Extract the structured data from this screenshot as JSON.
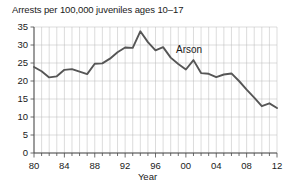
{
  "chart_data": {
    "type": "line",
    "title": "Arrests per 100,000 juveniles ages 10–17",
    "xlabel": "Year",
    "ylabel": "",
    "series_label": "Arson",
    "grid": true,
    "legend_position": "inline-annotation",
    "xlim": [
      1980,
      2012
    ],
    "ylim": [
      0,
      35
    ],
    "ytick_values": [
      0,
      5,
      10,
      15,
      20,
      25,
      30,
      35
    ],
    "ytick_labels": [
      "0",
      "5",
      "10",
      "15",
      "20",
      "25",
      "30",
      "35"
    ],
    "xtick_values": [
      1980,
      1984,
      1988,
      1992,
      1996,
      2000,
      2004,
      2008,
      2012
    ],
    "xtick_labels": [
      "80",
      "84",
      "88",
      "92",
      "96",
      "00",
      "04",
      "08",
      "12"
    ],
    "xtick_minor_step": 1,
    "series": [
      {
        "name": "Arson",
        "x": [
          1980,
          1981,
          1982,
          1983,
          1984,
          1985,
          1986,
          1987,
          1988,
          1989,
          1990,
          1991,
          1992,
          1993,
          1994,
          1995,
          1996,
          1997,
          1998,
          1999,
          2000,
          2001,
          2002,
          2003,
          2004,
          2005,
          2006,
          2007,
          2008,
          2009,
          2010,
          2011,
          2012
        ],
        "values": [
          23.9,
          22.7,
          21.0,
          21.3,
          23.1,
          23.3,
          22.6,
          21.9,
          24.8,
          24.9,
          26.2,
          28.0,
          29.3,
          29.2,
          33.8,
          30.8,
          28.5,
          29.4,
          26.5,
          24.7,
          23.2,
          25.8,
          22.2,
          22.0,
          21.1,
          21.8,
          22.1,
          20.0,
          17.6,
          15.4,
          13.0,
          13.8,
          12.5
        ]
      }
    ]
  },
  "annotations": {
    "series_callout": "Arson"
  }
}
